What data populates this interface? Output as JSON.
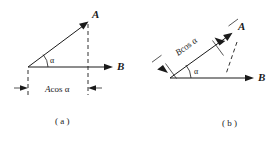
{
  "figure": {
    "background_color": "#ffffff",
    "ink_color": "#1a1a1a",
    "panels": [
      {
        "id": "a",
        "caption": "( a )",
        "vector_a_label": "A",
        "vector_b_label": "B",
        "angle_label": "α",
        "projection_label_italic": "A",
        "projection_label_rest": "cos α",
        "projection_label_full": "A cos α",
        "description": "Projection of A onto B shown along horizontal axis"
      },
      {
        "id": "b",
        "caption": "( b )",
        "vector_a_label": "A",
        "vector_b_label": "B",
        "angle_label": "α",
        "projection_label_italic": "B",
        "projection_label_rest": "cos α",
        "projection_label_full": "B cos α",
        "description": "Projection of B onto A shown along the A direction"
      }
    ]
  }
}
